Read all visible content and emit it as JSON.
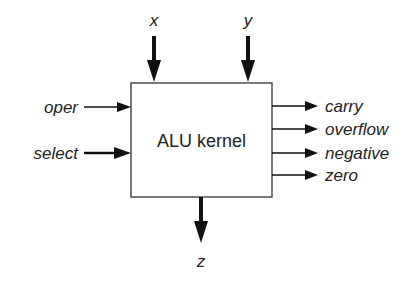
{
  "diagram": {
    "block": {
      "label": "ALU kernel"
    },
    "inputs_top": [
      {
        "label": "x"
      },
      {
        "label": "y"
      }
    ],
    "inputs_left": [
      {
        "label": "oper"
      },
      {
        "label": "select"
      }
    ],
    "outputs_right": [
      {
        "label": "carry"
      },
      {
        "label": "overflow"
      },
      {
        "label": "negative"
      },
      {
        "label": "zero"
      }
    ],
    "output_bottom": {
      "label": "z"
    },
    "colors": {
      "stroke": "#222222",
      "background": "#ffffff"
    }
  }
}
